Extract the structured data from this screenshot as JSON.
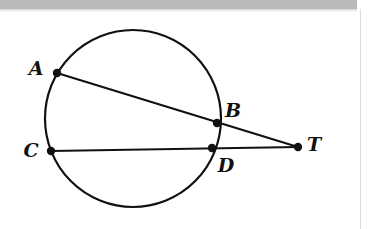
{
  "figure": {
    "kind": "circle-geometry-diagram",
    "stroke_color": "#111111",
    "fill_color": "#ffffff",
    "background_color": "#ffffff",
    "stroke_width": 2.2,
    "point_radius": 4.2,
    "circle": {
      "cx": 133,
      "cy": 118.5,
      "rx": 88,
      "ry": 88.5
    },
    "points": [
      {
        "id": "A",
        "label": "A",
        "x": 57,
        "y": 73,
        "label_x": 36,
        "label_y": 68
      },
      {
        "id": "B",
        "label": "B",
        "x": 217,
        "y": 123,
        "label_x": 233,
        "label_y": 110
      },
      {
        "id": "C",
        "label": "C",
        "x": 51,
        "y": 151,
        "label_x": 31,
        "label_y": 150
      },
      {
        "id": "D",
        "label": "D",
        "x": 212,
        "y": 148,
        "label_x": 226,
        "label_y": 165
      },
      {
        "id": "T",
        "label": "T",
        "x": 298,
        "y": 147,
        "label_x": 314,
        "label_y": 144
      }
    ],
    "segments": [
      {
        "id": "secant-ABT",
        "from": "A",
        "to": "T",
        "x1": 57,
        "y1": 73,
        "x2": 298,
        "y2": 147
      },
      {
        "id": "secant-CDT",
        "from": "C",
        "to": "T",
        "x1": 51,
        "y1": 151,
        "x2": 298,
        "y2": 147
      }
    ]
  },
  "page_artifacts": {
    "top_band_color": "#b9b9b9",
    "right_rule_color": "#dcdcdc"
  }
}
